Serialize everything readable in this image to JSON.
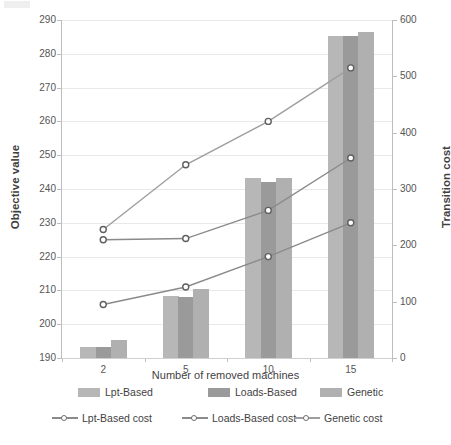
{
  "chart_data": {
    "type": "bar",
    "title": "",
    "xlabel": "Number of removed machines",
    "ylabel": "Objective value",
    "y2label": "Transition cost",
    "categories": [
      "2",
      "5",
      "10",
      "15"
    ],
    "ylim": [
      190,
      290
    ],
    "yticks": [
      190,
      200,
      210,
      220,
      230,
      240,
      250,
      260,
      270,
      280,
      290
    ],
    "y2lim": [
      0,
      600
    ],
    "y2ticks": [
      0,
      100,
      200,
      300,
      400,
      500,
      600
    ],
    "grid": true,
    "legend_position": "bottom",
    "bar_series": [
      {
        "name": "Lpt-Based",
        "color": "#b7b7b7",
        "values": [
          193.2,
          208.3,
          243.3,
          285.3
        ]
      },
      {
        "name": "Loads-Based",
        "color": "#9a9a9a",
        "values": [
          193.2,
          208.1,
          242.2,
          285.3
        ]
      },
      {
        "name": "Genetic",
        "color": "#b0b0b0",
        "values": [
          195.2,
          210.4,
          243.3,
          286.4
        ]
      }
    ],
    "line_series": [
      {
        "name": "Lpt-Based cost",
        "axis": "right",
        "color": "#8a8a8a",
        "values": [
          95,
          126,
          180,
          240
        ]
      },
      {
        "name": "Loads-Based cost",
        "axis": "right",
        "color": "#8a8a8a",
        "values": [
          210,
          212,
          262,
          355
        ]
      },
      {
        "name": "Genetic cost",
        "axis": "right",
        "color": "#9e9e9e",
        "values": [
          228,
          343,
          420,
          515
        ]
      }
    ]
  },
  "legend": {
    "bars": [
      {
        "label": "Lpt-Based"
      },
      {
        "label": "Loads-Based"
      },
      {
        "label": "Genetic"
      }
    ],
    "lines": [
      {
        "label": "Lpt-Based cost"
      },
      {
        "label": "Loads-Based cost"
      },
      {
        "label": "Genetic cost"
      }
    ]
  },
  "axes": {
    "left_title": "Objective value",
    "right_title": "Transition cost",
    "x_title": "Number of removed machines",
    "left_ticks": [
      "290",
      "280",
      "270",
      "260",
      "250",
      "240",
      "230",
      "220",
      "210",
      "200",
      "190"
    ],
    "right_ticks": [
      "600",
      "500",
      "400",
      "300",
      "200",
      "100",
      "0"
    ],
    "x_ticks": [
      "2",
      "5",
      "10",
      "15"
    ]
  }
}
